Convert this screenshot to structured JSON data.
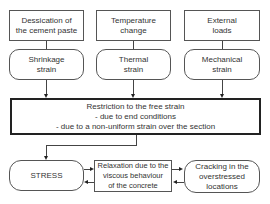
{
  "causes": [
    {
      "label": "Dessication of\nthe cement paste"
    },
    {
      "label": "Temperature\nchange"
    },
    {
      "label": "External\nloads"
    }
  ],
  "strains": [
    {
      "label": "Shrinkage\nstrain"
    },
    {
      "label": "Thermal\nstrain"
    },
    {
      "label": "Mechanical\nstrain"
    }
  ],
  "restriction": {
    "title": "Restriction to the free strain",
    "line1": "- due to end conditions",
    "line2": "- due to a non-uniform strain over the section"
  },
  "outcomes": {
    "stress": "STRESS",
    "relaxation": "Relaxation due to the\nviscous behaviour\nof the concrete",
    "cracking": "Cracking in the\noverstressed\nlocations"
  }
}
